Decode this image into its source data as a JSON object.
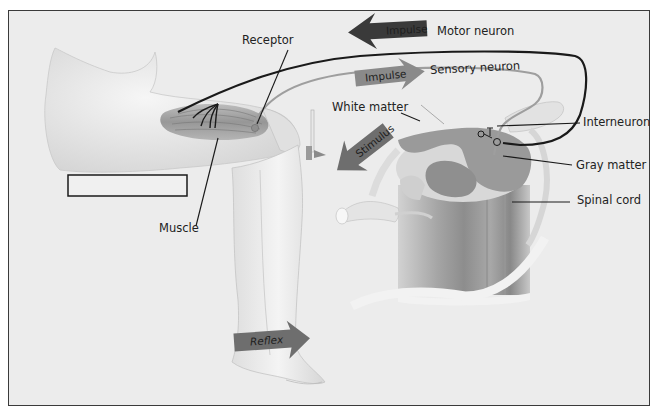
{
  "labels": {
    "receptor": "Receptor",
    "motor_neuron": "Motor neuron",
    "sensory_neuron": "Sensory neuron",
    "white_matter": "White matter",
    "interneuron": "Interneuron",
    "gray_matter": "Gray matter",
    "spinal_cord": "Spinal cord",
    "muscle": "Muscle"
  },
  "arrows": {
    "motor_impulse": {
      "text": "Impulse",
      "direction": "left",
      "color": "#3a3a3a"
    },
    "sensory_impulse": {
      "text": "Impulse",
      "direction": "right",
      "color": "#8a8a8a"
    },
    "stimulus": {
      "text": "Stimulus",
      "direction": "down-left",
      "color": "#6e6e6e"
    },
    "reflex": {
      "text": "Reflex",
      "direction": "right",
      "color": "#6e6e6e"
    }
  },
  "blank_label_box": "",
  "caption_partial": "",
  "colors": {
    "background": "#ececec",
    "frame_border": "#3a3a3a",
    "motor_line": "#1a1a1a",
    "sensory_line": "#9a9a9a",
    "gray_matter": "#8c8c8c",
    "white_matter": "#d8d8d8",
    "skin": "#e6e6e6",
    "muscle": "#9a9a9a"
  }
}
